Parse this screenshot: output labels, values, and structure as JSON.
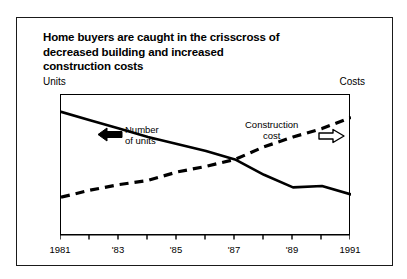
{
  "chart_data": {
    "type": "line",
    "title": "Home buyers are caught in the crisscross of decreased building and increased construction costs",
    "title_lines": [
      "Home buyers are caught in the crisscross of",
      "decreased building and increased",
      "construction costs"
    ],
    "left_axis_label": "Units",
    "right_axis_label": "Costs",
    "xlabel": "",
    "ylabel": "",
    "grid": false,
    "legend_position": "inline-annotations",
    "x": [
      1981,
      1982,
      1983,
      1984,
      1985,
      1986,
      1987,
      1988,
      1989,
      1990,
      1991
    ],
    "tick_labels": [
      {
        "x": 1981,
        "label": "1981"
      },
      {
        "x": 1982,
        "label": ""
      },
      {
        "x": 1983,
        "label": "'83"
      },
      {
        "x": 1984,
        "label": ""
      },
      {
        "x": 1985,
        "label": "'85"
      },
      {
        "x": 1986,
        "label": ""
      },
      {
        "x": 1987,
        "label": "'87"
      },
      {
        "x": 1988,
        "label": ""
      },
      {
        "x": 1989,
        "label": "'89"
      },
      {
        "x": 1990,
        "label": ""
      },
      {
        "x": 1991,
        "label": "1991"
      }
    ],
    "series": [
      {
        "name": "Number of units",
        "axis": "left",
        "style": "solid",
        "color": "#000000",
        "values": [
          88,
          82,
          76,
          70,
          65,
          60,
          54,
          43,
          34,
          35,
          29
        ],
        "annotation": {
          "line1": "Number",
          "line2": "of units",
          "arrow": "left-filled"
        }
      },
      {
        "name": "Construction cost",
        "axis": "right",
        "style": "dashed",
        "color": "#000000",
        "values": [
          27,
          32,
          36,
          39,
          45,
          49,
          54,
          63,
          70,
          76,
          84
        ],
        "annotation": {
          "line1": "Construction",
          "line2": "cost",
          "arrow": "right-hollow"
        }
      }
    ],
    "crossover_year": 1987,
    "ylim": [
      0,
      100
    ]
  }
}
